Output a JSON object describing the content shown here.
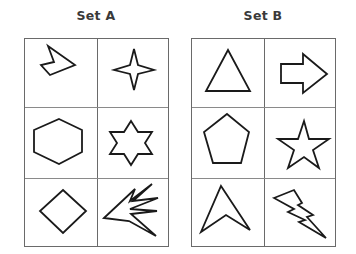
{
  "sets": [
    {
      "title": "Set A",
      "cells": [
        {
          "row": 0,
          "col": 0,
          "shape": "irregular-arrowhead-polygon"
        },
        {
          "row": 0,
          "col": 1,
          "shape": "four-point-star"
        },
        {
          "row": 1,
          "col": 0,
          "shape": "hexagon"
        },
        {
          "row": 1,
          "col": 1,
          "shape": "six-point-star"
        },
        {
          "row": 2,
          "col": 0,
          "shape": "diamond"
        },
        {
          "row": 2,
          "col": 1,
          "shape": "burst-spike-polygon"
        }
      ]
    },
    {
      "title": "Set B",
      "cells": [
        {
          "row": 0,
          "col": 0,
          "shape": "triangle"
        },
        {
          "row": 0,
          "col": 1,
          "shape": "right-arrow"
        },
        {
          "row": 1,
          "col": 0,
          "shape": "pentagon"
        },
        {
          "row": 1,
          "col": 1,
          "shape": "five-point-star"
        },
        {
          "row": 2,
          "col": 0,
          "shape": "arrowhead-chevron"
        },
        {
          "row": 2,
          "col": 1,
          "shape": "lightning-bolt"
        }
      ]
    }
  ],
  "colors": {
    "stroke": "#1a1a1a",
    "grid": "#6a6a6a",
    "title": "#3a3a3a",
    "background": "#ffffff"
  }
}
